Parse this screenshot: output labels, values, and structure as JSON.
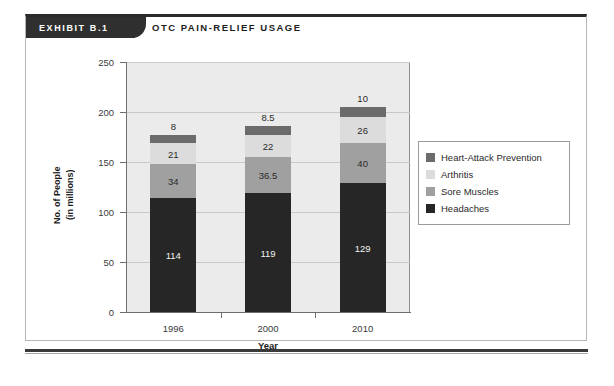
{
  "exhibit": {
    "tab_label": "EXHIBIT B.1",
    "title": "OTC PAIN-RELIEF USAGE"
  },
  "colors": {
    "heart_attack_prevention": "#6b6b6b",
    "arthritis": "#dcdcdc",
    "sore_muscles": "#a0a0a0",
    "headaches": "#262626",
    "plot_background": "#ebebeb",
    "gridline": "#c9c9c9",
    "frame": "#2b2b2b"
  },
  "chart_data": {
    "type": "bar",
    "subtype": "stacked-vertical",
    "title": "OTC PAIN-RELIEF USAGE",
    "xlabel": "Year",
    "ylabel": "No. of People (in millions)",
    "ylabel_lines": [
      "No. of People",
      "(in millions)"
    ],
    "categories": [
      "1996",
      "2000",
      "2010"
    ],
    "ylim": [
      0,
      250
    ],
    "yticks": [
      0,
      50,
      100,
      150,
      200,
      250
    ],
    "ytick_labels": [
      "0",
      "50",
      "100",
      "150",
      "200",
      "250"
    ],
    "grid": true,
    "legend_position": "right",
    "series": [
      {
        "name": "Headaches",
        "color": "#262626",
        "values": [
          114,
          119,
          129
        ],
        "labels": [
          "114",
          "119",
          "129"
        ],
        "label_position": "inside"
      },
      {
        "name": "Sore Muscles",
        "color": "#a0a0a0",
        "values": [
          34,
          36.5,
          40
        ],
        "labels": [
          "34",
          "36.5",
          "40"
        ],
        "label_position": "inside"
      },
      {
        "name": "Arthritis",
        "color": "#dcdcdc",
        "values": [
          21,
          22,
          26
        ],
        "labels": [
          "21",
          "22",
          "26"
        ],
        "label_position": "inside"
      },
      {
        "name": "Heart-Attack Prevention",
        "color": "#6b6b6b",
        "values": [
          8,
          8.5,
          10
        ],
        "labels": [
          "8",
          "8.5",
          "10"
        ],
        "label_position": "above-bar"
      }
    ],
    "stack_totals": [
      177,
      186,
      205
    ]
  },
  "legend": {
    "entries": [
      {
        "label": "Heart-Attack Prevention",
        "color": "#6b6b6b"
      },
      {
        "label": "Arthritis",
        "color": "#dcdcdc"
      },
      {
        "label": "Sore Muscles",
        "color": "#a0a0a0"
      },
      {
        "label": "Headaches",
        "color": "#262626"
      }
    ]
  }
}
